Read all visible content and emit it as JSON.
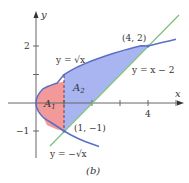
{
  "figure": {
    "caption": "(b)",
    "axes": {
      "x_label": "x",
      "y_label": "y",
      "x_ticks": [
        {
          "value": 4,
          "label": "4"
        }
      ],
      "y_ticks": [
        {
          "value": 2,
          "label": "2"
        },
        {
          "value": -1,
          "label": "−1"
        }
      ]
    },
    "curves": {
      "upper": {
        "label": "y = √x"
      },
      "lower": {
        "label": "y = −√x"
      },
      "line": {
        "label": "y = x − 2"
      }
    },
    "points": [
      {
        "label": "(4, 2)",
        "x": 4,
        "y": 2
      },
      {
        "label": "(1, −1)",
        "x": 1,
        "y": -1
      }
    ],
    "regions": {
      "a1": {
        "label": "A",
        "sub": "1"
      },
      "a2": {
        "label": "A",
        "sub": "2"
      }
    },
    "colors": {
      "region_a1": "#f29a9a",
      "region_a2": "#a9b5f0",
      "parabola": "#5b6fc7",
      "line": "#7cbf7c",
      "axis": "#555555"
    }
  }
}
